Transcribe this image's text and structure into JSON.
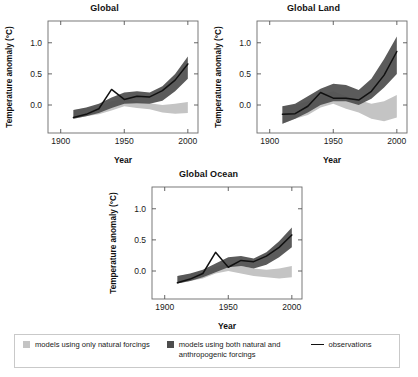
{
  "figure": {
    "panels": [
      {
        "title": "Global",
        "key": "global"
      },
      {
        "title": "Global Land",
        "key": "global_land"
      },
      {
        "title": "Global Ocean",
        "key": "global_ocean"
      }
    ]
  },
  "axis": {
    "xlabel": "Year",
    "ylabel": "Temperature anomaly (°C)",
    "xticks": [
      "1900",
      "1950",
      "2000"
    ],
    "yticks": [
      "0.0",
      "0.5",
      "1.0"
    ]
  },
  "legend": {
    "items": [
      {
        "name": "natural-forcings",
        "label": "models using only natural forcings",
        "swatch": "light-gray-square",
        "color": "#c4c4c4"
      },
      {
        "name": "anthropogenic-forcings",
        "label": "models using both natural and anthropogenic forcings",
        "swatch": "dark-gray-square",
        "color": "#4d4d4d"
      },
      {
        "name": "observations",
        "label": "observations",
        "swatch": "black-line",
        "color": "#111111"
      }
    ]
  },
  "colors": {
    "natural_band": "#c4c4c4",
    "anthropogenic_band": "#4d4d4d",
    "observations_line": "#111111",
    "axis": "#555555",
    "frame": "#6b6b6b",
    "background": "#ffffff"
  },
  "chart_data": [
    {
      "type": "area",
      "key": "global",
      "title": "Global",
      "xlabel": "Year",
      "ylabel": "Temperature anomaly (°C)",
      "xlim": [
        1890,
        2008
      ],
      "ylim": [
        -0.45,
        1.35
      ],
      "xticks": [
        1900,
        1950,
        2000
      ],
      "yticks": [
        0.0,
        0.5,
        1.0
      ],
      "grid": false,
      "legend_position": "below-figure",
      "x": [
        1910,
        1920,
        1930,
        1940,
        1950,
        1960,
        1970,
        1980,
        1990,
        2000
      ],
      "series": [
        {
          "name": "models using both natural and anthropogenic forcings",
          "type": "band",
          "lower": [
            -0.22,
            -0.18,
            -0.13,
            -0.05,
            0.02,
            0.03,
            0.02,
            0.07,
            0.22,
            0.42
          ],
          "upper": [
            -0.08,
            -0.04,
            0.02,
            0.12,
            0.2,
            0.22,
            0.2,
            0.3,
            0.5,
            0.78
          ]
        },
        {
          "name": "models using only natural forcings",
          "type": "band",
          "lower": [
            -0.22,
            -0.18,
            -0.15,
            -0.09,
            -0.02,
            -0.05,
            -0.07,
            -0.12,
            -0.14,
            -0.13
          ],
          "upper": [
            -0.08,
            -0.05,
            -0.02,
            0.06,
            0.1,
            0.06,
            0.03,
            0.0,
            0.02,
            0.05
          ]
        },
        {
          "name": "observations",
          "type": "line",
          "values": [
            -0.2,
            -0.15,
            -0.06,
            0.25,
            0.09,
            0.14,
            0.13,
            0.23,
            0.4,
            0.66
          ]
        }
      ]
    },
    {
      "type": "area",
      "key": "global_land",
      "title": "Global Land",
      "xlabel": "Year",
      "ylabel": "Temperature anomaly (°C)",
      "xlim": [
        1890,
        2008
      ],
      "ylim": [
        -0.45,
        1.35
      ],
      "xticks": [
        1900,
        1950,
        2000
      ],
      "yticks": [
        0.0,
        0.5,
        1.0
      ],
      "grid": false,
      "legend_position": "below-figure",
      "x": [
        1910,
        1920,
        1930,
        1940,
        1950,
        1960,
        1970,
        1980,
        1990,
        2000
      ],
      "series": [
        {
          "name": "models using both natural and anthropogenic forcings",
          "type": "band",
          "lower": [
            -0.3,
            -0.22,
            -0.12,
            0.0,
            0.06,
            0.06,
            0.0,
            0.1,
            0.28,
            0.5
          ],
          "upper": [
            -0.02,
            0.02,
            0.14,
            0.26,
            0.34,
            0.32,
            0.24,
            0.42,
            0.74,
            1.1
          ]
        },
        {
          "name": "models using only natural forcings",
          "type": "band",
          "lower": [
            -0.3,
            -0.22,
            -0.16,
            -0.04,
            0.02,
            -0.06,
            -0.12,
            -0.22,
            -0.26,
            -0.2
          ],
          "upper": [
            -0.02,
            0.0,
            0.06,
            0.16,
            0.22,
            0.14,
            0.08,
            0.02,
            0.06,
            0.16
          ]
        },
        {
          "name": "observations",
          "type": "line",
          "values": [
            -0.15,
            -0.14,
            -0.02,
            0.2,
            0.11,
            0.11,
            0.08,
            0.22,
            0.48,
            0.86
          ]
        }
      ]
    },
    {
      "type": "area",
      "key": "global_ocean",
      "title": "Global Ocean",
      "xlabel": "Year",
      "ylabel": "Temperature anomaly (°C)",
      "xlim": [
        1890,
        2008
      ],
      "ylim": [
        -0.45,
        1.35
      ],
      "xticks": [
        1900,
        1950,
        2000
      ],
      "yticks": [
        0.0,
        0.5,
        1.0
      ],
      "grid": false,
      "legend_position": "below-figure",
      "x": [
        1910,
        1920,
        1930,
        1940,
        1950,
        1960,
        1970,
        1980,
        1990,
        2000
      ],
      "series": [
        {
          "name": "models using both natural and anthropogenic forcings",
          "type": "band",
          "lower": [
            -0.2,
            -0.16,
            -0.1,
            -0.02,
            0.06,
            0.08,
            0.04,
            0.1,
            0.22,
            0.38
          ],
          "upper": [
            -0.08,
            -0.04,
            0.02,
            0.12,
            0.22,
            0.24,
            0.2,
            0.3,
            0.48,
            0.7
          ]
        },
        {
          "name": "models using only natural forcings",
          "type": "band",
          "lower": [
            -0.2,
            -0.16,
            -0.12,
            -0.04,
            0.0,
            -0.04,
            -0.08,
            -0.1,
            -0.12,
            -0.1
          ],
          "upper": [
            -0.08,
            -0.05,
            0.0,
            0.07,
            0.12,
            0.08,
            0.04,
            0.02,
            0.04,
            0.08
          ]
        },
        {
          "name": "observations",
          "type": "line",
          "values": [
            -0.19,
            -0.13,
            -0.04,
            0.3,
            0.06,
            0.17,
            0.15,
            0.24,
            0.38,
            0.58
          ]
        }
      ]
    }
  ]
}
